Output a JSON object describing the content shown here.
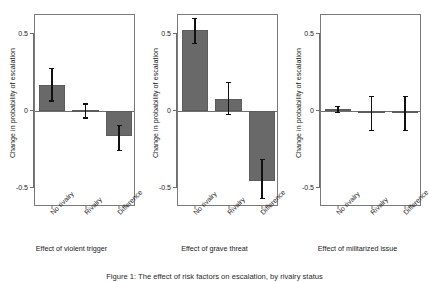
{
  "figure": {
    "caption": "Figure 1: The effect of risk factors on escalation, by rivalry status"
  },
  "chart_data": {
    "type": "bar",
    "title": "",
    "categories": [
      "No rivalry",
      "Rivalry",
      "Difference"
    ],
    "ylabel": "Change in probability of escalation",
    "ylim": [
      -0.62,
      0.62
    ],
    "yticks": [
      -0.5,
      0,
      0.5
    ],
    "ytick_labels": [
      "-0.5",
      "0",
      "0.5"
    ],
    "grid": false,
    "legend": "none",
    "bar_color": "#696969",
    "errorbar_color": "#111111",
    "panels": [
      {
        "xlabel": "Effect of violent trigger",
        "values": [
          0.17,
          0.005,
          -0.16
        ],
        "err_low": [
          0.07,
          -0.04,
          -0.25
        ],
        "err_high": [
          0.28,
          0.05,
          -0.09
        ]
      },
      {
        "xlabel": "Effect of grave threat",
        "values": [
          0.52,
          0.08,
          -0.45
        ],
        "err_low": [
          0.44,
          -0.02,
          -0.56
        ],
        "err_high": [
          0.6,
          0.19,
          -0.31
        ]
      },
      {
        "xlabel": "Effect of militarized issue",
        "values": [
          0.012,
          0.0,
          -0.005
        ],
        "err_low": [
          -0.005,
          -0.12,
          -0.12
        ],
        "err_high": [
          0.035,
          0.1,
          0.1
        ]
      }
    ]
  }
}
